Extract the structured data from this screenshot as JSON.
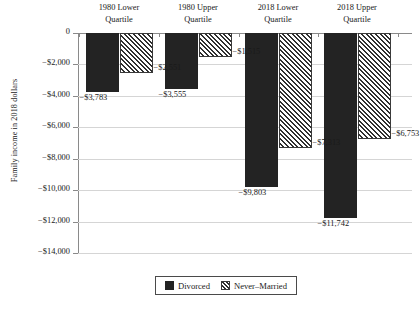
{
  "chart_data": {
    "type": "bar",
    "title": "",
    "subtitle": "",
    "xlabel": "",
    "ylabel": "Family income in 2018 dollars",
    "ylim": [
      -14000,
      0
    ],
    "ytick_step": 2000,
    "grid": true,
    "legend_position": "bottom",
    "categories": [
      "1980 Lower Quartile",
      "1980 Upper Quartile",
      "2018 Lower Quartile",
      "2018 Upper Quartile"
    ],
    "category_lines": [
      [
        "1980 Lower",
        "Quartile"
      ],
      [
        "1980 Upper",
        "Quartile"
      ],
      [
        "2018 Lower",
        "Quartile"
      ],
      [
        "2018 Upper",
        "Quartile"
      ]
    ],
    "series": [
      {
        "name": "Divorced",
        "pattern": "solid",
        "color": "#232323",
        "values": [
          -3783,
          -3555,
          -9803,
          -11742
        ],
        "labels": [
          "−$3,783",
          "−$3,555",
          "−$9,803",
          "−$11,742"
        ]
      },
      {
        "name": "Never-Married",
        "pattern": "diagonal-hatch",
        "color": "#303030",
        "values": [
          -2551,
          -1515,
          -7313,
          -6753
        ],
        "labels": [
          "−$2,551",
          "−$1,515",
          "−$7,313",
          "−$6,753"
        ]
      }
    ],
    "ytick_labels": [
      "0",
      "−$2,000",
      "−$4,000",
      "−$6,000",
      "−$8,000",
      "−$10,000",
      "−$12,000",
      "−$14,000"
    ],
    "ytick_values": [
      0,
      -2000,
      -4000,
      -6000,
      -8000,
      -10000,
      -12000,
      -14000
    ]
  },
  "legend": {
    "items": [
      {
        "label": "Divorced",
        "swatch": "solid-square-icon"
      },
      {
        "label": "Never–Married",
        "swatch": "hatched-square-icon"
      }
    ]
  }
}
